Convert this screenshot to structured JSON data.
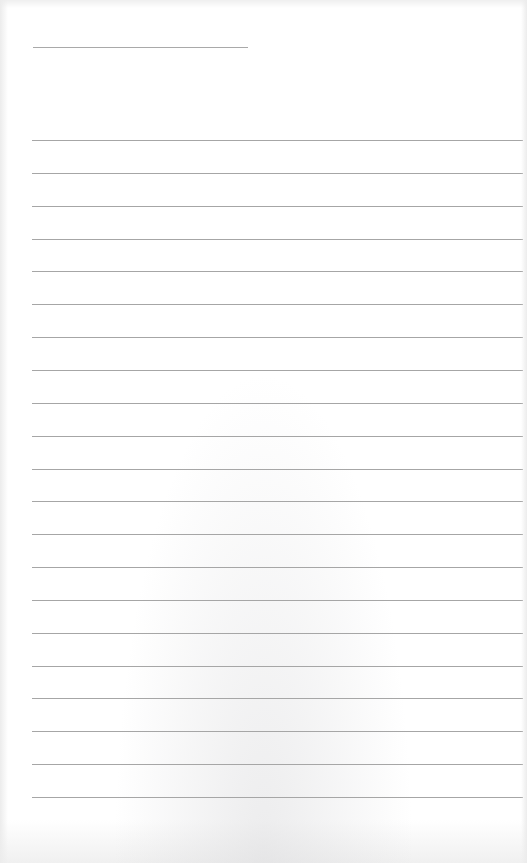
{
  "page": {
    "type": "lined-paper",
    "background_color": "#ffffff",
    "line_color": "#a6a6a6",
    "title_field": {
      "value": ""
    },
    "ruled_lines": {
      "count": 21,
      "first_y": 140,
      "spacing": 32.85,
      "entries": [
        "",
        "",
        "",
        "",
        "",
        "",
        "",
        "",
        "",
        "",
        "",
        "",
        "",
        "",
        "",
        "",
        "",
        "",
        "",
        "",
        ""
      ]
    }
  }
}
